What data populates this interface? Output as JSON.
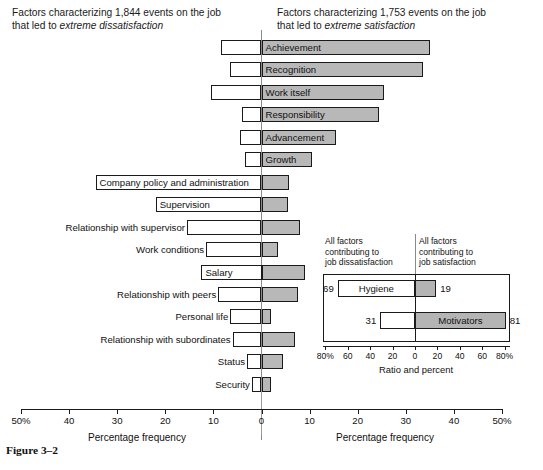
{
  "header": {
    "left_line1": "Factors characterizing 1,844 events on the job",
    "left_line2_prefix": "that led to ",
    "left_line2_em": "extreme dissatisfaction",
    "right_line1": "Factors characterizing 1,753 events on the job",
    "right_line2_prefix": "that led to ",
    "right_line2_em": "extreme satisfaction"
  },
  "axis": {
    "tick_labels": [
      "50%",
      "40",
      "30",
      "20",
      "10",
      "0",
      "10",
      "20",
      "30",
      "40",
      "50%"
    ],
    "title_left": "Percentage frequency",
    "title_right": "Percentage frequency"
  },
  "inset": {
    "caption_left": "All factors\ncontributing to\njob dissatisfaction",
    "caption_left_l1": "All factors",
    "caption_left_l2": "contributing to",
    "caption_left_l3": "job dissatisfaction",
    "caption_right_l1": "All factors",
    "caption_right_l2": "contributing to",
    "caption_right_l3": "job satisfaction",
    "rows": [
      {
        "label": "Hygiene",
        "dissatisfaction": 69,
        "satisfaction": 19,
        "label_side": "dis"
      },
      {
        "label": "Motivators",
        "dissatisfaction": 31,
        "satisfaction": 81,
        "label_side": "sat"
      }
    ],
    "tick_labels": [
      "80%",
      "60",
      "40",
      "20",
      "0",
      "20",
      "40",
      "60",
      "80%"
    ],
    "axis_title": "Ratio and percent"
  },
  "caption": "Figure 3–2",
  "chart_data": {
    "type": "bar",
    "orientation": "horizontal-diverging",
    "xlabel": "Percentage frequency",
    "xlim": [
      -50,
      50
    ],
    "grid": false,
    "legend": [
      "extreme dissatisfaction",
      "extreme satisfaction"
    ],
    "series": [
      {
        "name": "extreme dissatisfaction",
        "color": "#ffffff"
      },
      {
        "name": "extreme satisfaction",
        "color": "#b8b8b8"
      }
    ],
    "categories": [
      "Achievement",
      "Recognition",
      "Work itself",
      "Responsibility",
      "Advancement",
      "Growth",
      "Company policy and administration",
      "Supervision",
      "Relationship with supervisor",
      "Work conditions",
      "Salary",
      "Relationship with peers",
      "Personal life",
      "Relationship with subordinates",
      "Status",
      "Security"
    ],
    "bars": [
      {
        "category": "Achievement",
        "dissatisfaction": 8.5,
        "satisfaction": 35.0,
        "label_placement": "inside-right"
      },
      {
        "category": "Recognition",
        "dissatisfaction": 6.5,
        "satisfaction": 33.5,
        "label_placement": "inside-right"
      },
      {
        "category": "Work itself",
        "dissatisfaction": 10.5,
        "satisfaction": 25.5,
        "label_placement": "inside-right"
      },
      {
        "category": "Responsibility",
        "dissatisfaction": 4.0,
        "satisfaction": 24.5,
        "label_placement": "inside-right"
      },
      {
        "category": "Advancement",
        "dissatisfaction": 4.5,
        "satisfaction": 15.5,
        "label_placement": "inside-right"
      },
      {
        "category": "Growth",
        "dissatisfaction": 3.5,
        "satisfaction": 10.5,
        "label_placement": "inside-right"
      },
      {
        "category": "Company policy and administration",
        "dissatisfaction": 34.5,
        "satisfaction": 5.8,
        "label_placement": "inside-left"
      },
      {
        "category": "Supervision",
        "dissatisfaction": 22.0,
        "satisfaction": 5.5,
        "label_placement": "inside-left"
      },
      {
        "category": "Relationship with supervisor",
        "dissatisfaction": 15.5,
        "satisfaction": 8.0,
        "label_placement": "outside-left"
      },
      {
        "category": "Work conditions",
        "dissatisfaction": 11.5,
        "satisfaction": 3.5,
        "label_placement": "outside-left"
      },
      {
        "category": "Salary",
        "dissatisfaction": 12.5,
        "satisfaction": 9.0,
        "label_placement": "inside-left"
      },
      {
        "category": "Relationship with peers",
        "dissatisfaction": 9.0,
        "satisfaction": 7.5,
        "label_placement": "outside-left"
      },
      {
        "category": "Personal life",
        "dissatisfaction": 6.5,
        "satisfaction": 2.0,
        "label_placement": "outside-left"
      },
      {
        "category": "Relationship with subordinates",
        "dissatisfaction": 6.0,
        "satisfaction": 7.0,
        "label_placement": "outside-left"
      },
      {
        "category": "Status",
        "dissatisfaction": 3.0,
        "satisfaction": 4.5,
        "label_placement": "outside-left"
      },
      {
        "category": "Security",
        "dissatisfaction": 2.0,
        "satisfaction": 2.0,
        "label_placement": "outside-left"
      }
    ],
    "inset_chart": {
      "type": "bar",
      "orientation": "horizontal-diverging",
      "xlabel": "Ratio and percent",
      "xlim": [
        -80,
        80
      ],
      "categories": [
        "Hygiene",
        "Motivators"
      ],
      "series": [
        {
          "name": "contributing to job dissatisfaction",
          "values": [
            69,
            31
          ]
        },
        {
          "name": "contributing to job satisfaction",
          "values": [
            19,
            81
          ]
        }
      ]
    }
  }
}
